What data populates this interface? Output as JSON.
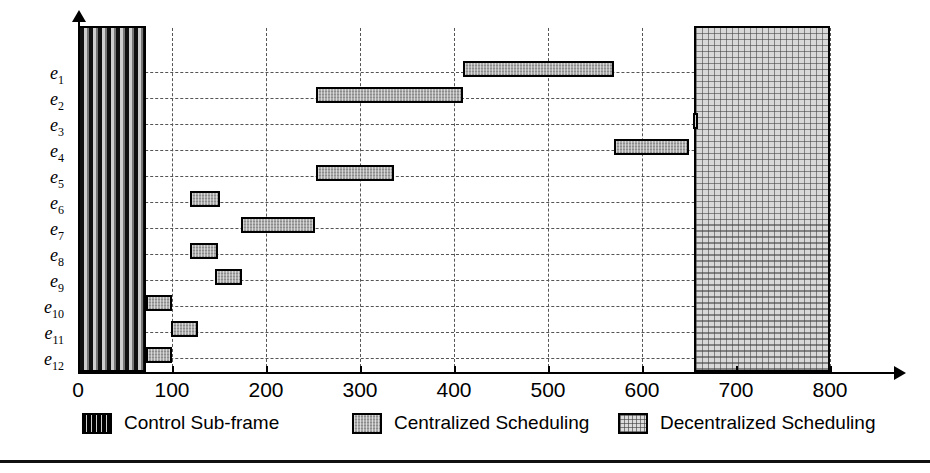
{
  "chart_data": {
    "type": "bar",
    "orientation": "horizontal",
    "title": "",
    "subtitle": "",
    "xlabel": "",
    "ylabel": "",
    "xlim": [
      0,
      830
    ],
    "ylim": [
      0,
      12
    ],
    "grid": true,
    "grid_style": "dashed",
    "legend_position": "bottom",
    "x_ticks": [
      0,
      100,
      200,
      300,
      400,
      500,
      600,
      700,
      800
    ],
    "x_tick_labels": [
      "0",
      "100",
      "200",
      "300",
      "400",
      "500",
      "600",
      "700",
      "800"
    ],
    "categories": [
      "e1",
      "e2",
      "e3",
      "e4",
      "e5",
      "e6",
      "e7",
      "e8",
      "e9",
      "e10",
      "e11",
      "e12"
    ],
    "category_labels": [
      {
        "base": "e",
        "sub": "1"
      },
      {
        "base": "e",
        "sub": "2"
      },
      {
        "base": "e",
        "sub": "3"
      },
      {
        "base": "e",
        "sub": "4"
      },
      {
        "base": "e",
        "sub": "5"
      },
      {
        "base": "e",
        "sub": "6"
      },
      {
        "base": "e",
        "sub": "7"
      },
      {
        "base": "e",
        "sub": "8"
      },
      {
        "base": "e",
        "sub": "9"
      },
      {
        "base": "e",
        "sub": "10"
      },
      {
        "base": "e",
        "sub": "11"
      },
      {
        "base": "e",
        "sub": "12"
      }
    ],
    "series": [
      {
        "name": "Centralized Scheduling",
        "pattern": "centralized",
        "intervals": [
          {
            "category": "e1",
            "start": 410,
            "end": 570
          },
          {
            "category": "e2",
            "start": 253,
            "end": 410
          },
          {
            "category": "e3",
            "start": 654,
            "end": 659
          },
          {
            "category": "e4",
            "start": 570,
            "end": 650
          },
          {
            "category": "e5",
            "start": 253,
            "end": 336
          },
          {
            "category": "e6",
            "start": 119,
            "end": 151
          },
          {
            "category": "e7",
            "start": 173,
            "end": 252
          },
          {
            "category": "e8",
            "start": 119,
            "end": 149
          },
          {
            "category": "e9",
            "start": 146,
            "end": 174
          },
          {
            "category": "e10",
            "start": 72,
            "end": 100
          },
          {
            "category": "e11",
            "start": 99,
            "end": 128
          },
          {
            "category": "e12",
            "start": 72,
            "end": 100
          }
        ]
      }
    ],
    "regions": [
      {
        "name": "Control Sub-frame",
        "pattern": "control",
        "start": 0,
        "end": 72
      },
      {
        "name": "Decentralized Scheduling",
        "pattern": "decentral",
        "start": 655,
        "end": 800
      }
    ],
    "legend": [
      {
        "label": "Control Sub-frame",
        "pattern": "control"
      },
      {
        "label": "Centralized Scheduling",
        "pattern": "central"
      },
      {
        "label": "Decentralized Scheduling",
        "pattern": "decentral"
      }
    ]
  },
  "colors": {
    "axis": "#000000",
    "grid": "#555555",
    "bar_fill": "#a9a9a9",
    "control_fill": "#111111",
    "decentral_fill": "#d8d8d8",
    "background": "#ffffff"
  }
}
